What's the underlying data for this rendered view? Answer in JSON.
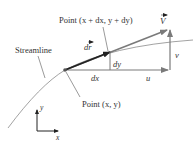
{
  "labels": {
    "streamline": "Streamline",
    "point_xy": "Point (x, y)",
    "point_dxdy": "Point (x + dx, y + dy)",
    "velocity": "V",
    "dr": "dr",
    "dx": "dx",
    "dy": "dy",
    "u": "u",
    "v": "v",
    "axis_x": "x",
    "axis_y": "y"
  },
  "colors": {
    "vector_dark": "#2a2a2a",
    "vector_gray": "#7a7a7a",
    "streamline": "#8a8a8a",
    "text": "#333333"
  }
}
